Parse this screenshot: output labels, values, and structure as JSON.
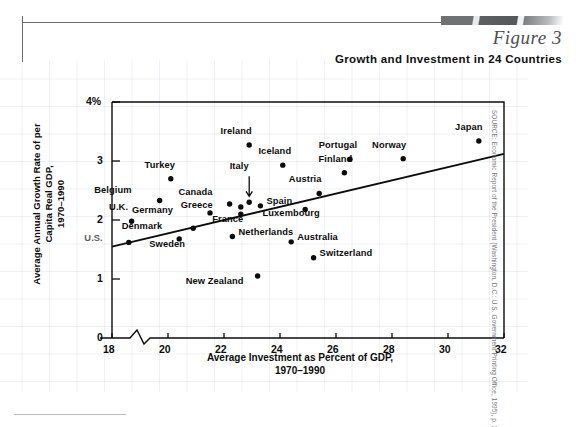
{
  "header": {
    "figure_label": "Figure 3",
    "title": "Growth and Investment in 24 Countries"
  },
  "source": "SOURCE: Economic Report of the President (Washington, D.C.: U.S. Government Printing Office, 1995), p. 28.",
  "colors": {
    "ink": "#0c0c0c",
    "rule": "#6d6f72",
    "grid": "#7891af",
    "muted": "#5b5d60"
  },
  "chart_data": {
    "type": "scatter",
    "title": "Growth and Investment in 24 Countries",
    "xlabel": "Average Investment as Percent of GDP, 1970–1990",
    "ylabel": "Average Annual Growth Rate of per Capita Real GDP, 1970–1990",
    "xlim": [
      18,
      32
    ],
    "ylim": [
      0,
      4
    ],
    "xticks": [
      18,
      20,
      22,
      24,
      26,
      28,
      30,
      32
    ],
    "yticks": [
      0,
      1,
      2,
      3,
      4
    ],
    "ytick_labels": [
      "0",
      "1",
      "2",
      "3",
      "4%"
    ],
    "axis_break": true,
    "grid": false,
    "legend": "none",
    "trendline": {
      "x0": 18,
      "y0": 1.55,
      "x1": 32,
      "y1": 3.12
    },
    "points": [
      {
        "name": "U.S.",
        "x": 18.6,
        "y": 1.62,
        "label_dx": -34,
        "label_dy": -4,
        "muted": true
      },
      {
        "name": "U.K.",
        "x": 18.7,
        "y": 1.98,
        "label_dx": -13,
        "label_dy": -14
      },
      {
        "name": "Turkey",
        "x": 20.1,
        "y": 2.7,
        "label_dx": -11,
        "label_dy": -14
      },
      {
        "name": "Belgium",
        "x": 19.7,
        "y": 2.33,
        "label_dx": -36,
        "label_dy": -11
      },
      {
        "name": "Denmark",
        "x": 20.9,
        "y": 1.86,
        "label_dx": -39,
        "label_dy": -2
      },
      {
        "name": "Sweden",
        "x": 20.4,
        "y": 1.68,
        "label_dx": -12,
        "label_dy": 5
      },
      {
        "name": "Germany",
        "x": 21.5,
        "y": 2.12,
        "label_dx": -45,
        "label_dy": -3
      },
      {
        "name": "Canada",
        "x": 22.2,
        "y": 2.27,
        "label_dx": -25,
        "label_dy": -12
      },
      {
        "name": "Greece",
        "x": 22.6,
        "y": 2.22,
        "label_dx": -36,
        "label_dy": -2
      },
      {
        "name": "France",
        "x": 22.6,
        "y": 2.1,
        "label_dx": -13,
        "label_dy": 5
      },
      {
        "name": "Netherlands",
        "x": 22.3,
        "y": 1.72,
        "label_dx": 6,
        "label_dy": -5
      },
      {
        "name": "Italy",
        "x": 22.9,
        "y": 2.3,
        "label_dx": -10,
        "label_dy": -36,
        "leader": true
      },
      {
        "name": "Ireland",
        "x": 22.9,
        "y": 3.27,
        "label_dx": -13,
        "label_dy": -14
      },
      {
        "name": "Spain",
        "x": 23.3,
        "y": 2.24,
        "label_dx": 6,
        "label_dy": -5
      },
      {
        "name": "New Zealand",
        "x": 23.2,
        "y": 1.05,
        "label_dx": -22,
        "label_dy": 5
      },
      {
        "name": "Iceland",
        "x": 24.1,
        "y": 2.93,
        "label_dx": -8,
        "label_dy": -14
      },
      {
        "name": "Australia",
        "x": 24.4,
        "y": 1.63,
        "label_dx": 6,
        "label_dy": -5
      },
      {
        "name": "Austria",
        "x": 25.4,
        "y": 2.45,
        "label_dx": -14,
        "label_dy": -14
      },
      {
        "name": "Luxembourg",
        "x": 24.9,
        "y": 2.18,
        "label_dx": -14,
        "label_dy": 4
      },
      {
        "name": "Switzerland",
        "x": 25.2,
        "y": 1.36,
        "label_dx": 6,
        "label_dy": -5
      },
      {
        "name": "Finland",
        "x": 26.3,
        "y": 2.8,
        "label_dx": -9,
        "label_dy": -14
      },
      {
        "name": "Portugal",
        "x": 26.5,
        "y": 3.03,
        "label_dx": -12,
        "label_dy": -14
      },
      {
        "name": "Norway",
        "x": 28.4,
        "y": 3.04,
        "label_dx": -14,
        "label_dy": -14
      },
      {
        "name": "Japan",
        "x": 31.1,
        "y": 3.34,
        "label_dx": -10,
        "label_dy": -14
      }
    ]
  }
}
